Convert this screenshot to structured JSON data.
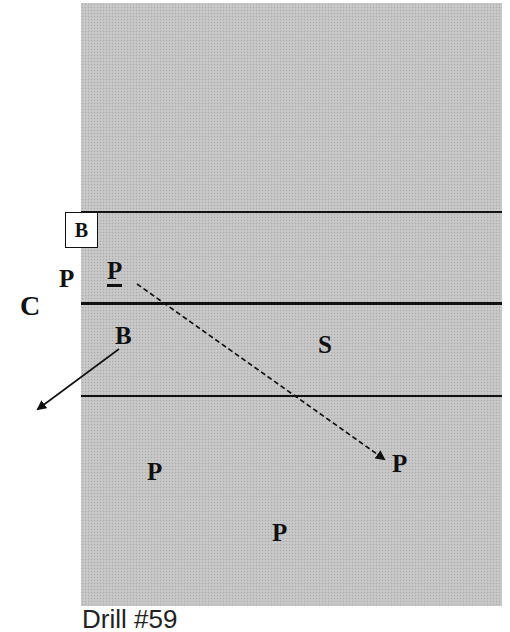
{
  "diagram": {
    "caption": "Drill #59",
    "court_color": "#c4c4c4",
    "line_color": "#111111",
    "lines": [
      {
        "name": "upper-line",
        "y": 212,
        "weight": "thin"
      },
      {
        "name": "center-line",
        "y": 304,
        "weight": "thick"
      },
      {
        "name": "lower-line",
        "y": 396,
        "weight": "thin"
      }
    ],
    "labels": {
      "boxed_b": "B",
      "p_outside": "P",
      "p_underlined": "P",
      "c": "C",
      "b_lower": "B",
      "s": "S",
      "p_right": "P",
      "p_lower_left": "P",
      "p_bottom": "P"
    },
    "arrows": [
      {
        "name": "dashed-pass-arrow",
        "from": "P (underlined)",
        "to": "P (right)",
        "style": "dashed"
      },
      {
        "name": "solid-move-arrow",
        "from": "B (lower)",
        "to": "outside left",
        "style": "solid"
      }
    ]
  }
}
